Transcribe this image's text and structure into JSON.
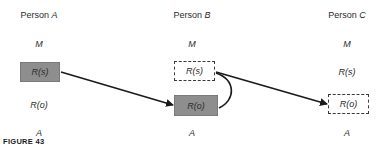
{
  "figure": {
    "label": "FIGURE 43"
  },
  "persons": [
    {
      "name_prefix": "Person ",
      "name_var": "A",
      "rows": {
        "M": "M",
        "Rs": "R(s)",
        "Ro": "R(o)",
        "A": "A"
      },
      "highlight": {
        "Rs": "filled",
        "Ro": "none"
      }
    },
    {
      "name_prefix": "Person ",
      "name_var": "B",
      "rows": {
        "M": "M",
        "Rs": "R(s)",
        "Ro": "R(o)",
        "A": "A"
      },
      "highlight": {
        "Rs": "dashed",
        "Ro": "filled"
      }
    },
    {
      "name_prefix": "Person ",
      "name_var": "C",
      "rows": {
        "M": "M",
        "Rs": "R(s)",
        "Ro": "R(o)",
        "A": "A"
      },
      "highlight": {
        "Rs": "none",
        "Ro": "dashed"
      }
    }
  ],
  "arrows": [
    {
      "from": "Person A R(s)",
      "to": "Person B R(o)",
      "style": "straight"
    },
    {
      "from": "Person B R(s)",
      "to": "Person B R(o)",
      "style": "curved"
    },
    {
      "from": "Person B R(s)",
      "to": "Person C R(o)",
      "style": "straight"
    }
  ],
  "colors": {
    "filled_box": "#8e8e8e",
    "line": "#1a1a1a",
    "text": "#2a2a2a"
  }
}
